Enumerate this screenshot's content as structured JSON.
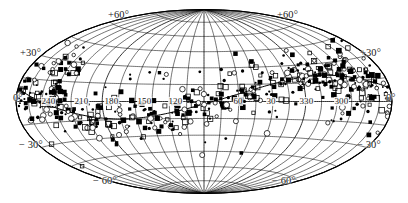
{
  "figure": {
    "name": "all-sky-aitoff-projection",
    "projection": "Aitoff equal-area all-sky map",
    "background_color": "#ffffff",
    "ink_color": "#000000"
  },
  "chart_data": {
    "type": "scatter",
    "title": "",
    "subtitle": "",
    "xlabel": "",
    "ylabel": "",
    "projection": "aitoff",
    "grid": true,
    "legend_position": "none",
    "xlim": [
      0,
      360
    ],
    "ylim": [
      -90,
      90
    ],
    "longitude_step": 15,
    "latitude_step": 15,
    "latitude_labels": [
      {
        "text": "+60°",
        "value": 60,
        "side": "left-top"
      },
      {
        "text": "+60°",
        "value": 60,
        "side": "right-top"
      },
      {
        "text": "+30°",
        "value": 30,
        "side": "left"
      },
      {
        "text": "+30°",
        "value": 30,
        "side": "right"
      },
      {
        "text": "0°",
        "value": 0,
        "side": "left"
      },
      {
        "text": "0°",
        "value": 0,
        "side": "right"
      },
      {
        "text": "− 30°",
        "value": -30,
        "side": "left"
      },
      {
        "text": "− 30°",
        "value": -30,
        "side": "right"
      },
      {
        "text": "− 60°",
        "value": -60,
        "side": "left-bottom"
      },
      {
        "text": "− 60°",
        "value": -60,
        "side": "right-bottom"
      }
    ],
    "longitude_labels": [
      {
        "text": "240",
        "value": 240
      },
      {
        "text": "210",
        "value": 210
      },
      {
        "text": "180",
        "value": 180
      },
      {
        "text": "150",
        "value": 150
      },
      {
        "text": "120",
        "value": 120
      },
      {
        "text": "60",
        "value": 60
      },
      {
        "text": "30",
        "value": 30
      },
      {
        "text": "330",
        "value": 330
      },
      {
        "text": "300",
        "value": 300
      }
    ],
    "marker_types": [
      {
        "name": "filled-square",
        "symbol": "■"
      },
      {
        "name": "open-square",
        "symbol": "□"
      },
      {
        "name": "open-circle",
        "symbol": "○"
      },
      {
        "name": "filled-dot",
        "symbol": "•"
      }
    ],
    "series": [
      {
        "name": "sources",
        "marker": "mixed",
        "count": 520,
        "note": "dense scatter of point sources concentrated along a band crossing the map"
      }
    ],
    "overlay_curve": {
      "name": "great-circle-band",
      "description": "wavy great-circle trace crossing the map near the equator"
    }
  },
  "labels": {
    "lat_plus60_left": "+60°",
    "lat_plus60_right": "+60°",
    "lat_plus30_left": "+30°",
    "lat_plus30_right": "+30°",
    "lat_zero_left": "0°",
    "lat_zero_right": "0°",
    "lat_minus30_left": "− 30°",
    "lat_minus30_right": "− 30°",
    "lat_minus60_left": "− 60°",
    "lat_minus60_right": "− 60°",
    "lon_240": "240",
    "lon_210": "210",
    "lon_180": "180",
    "lon_150": "150",
    "lon_120": "120",
    "lon_60": "60",
    "lon_30": "30",
    "lon_330": "330",
    "lon_300": "300"
  }
}
